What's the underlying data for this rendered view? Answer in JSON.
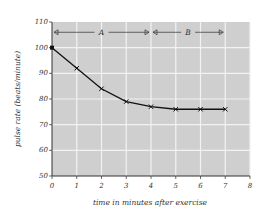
{
  "chart_data": {
    "type": "line",
    "title": "",
    "xlabel": "time in minutes after exercise",
    "ylabel": "pulse rate (beats/minute)",
    "x": [
      0,
      1,
      2,
      3,
      4,
      5,
      6,
      7
    ],
    "series": [
      {
        "name": "pulse rate",
        "values": [
          100,
          92,
          84,
          79,
          77,
          76,
          76,
          76
        ]
      }
    ],
    "xlim": [
      0,
      8
    ],
    "ylim": [
      50,
      110
    ],
    "xticks": [
      "0",
      "1",
      "2",
      "3",
      "4",
      "5",
      "6",
      "7",
      "8"
    ],
    "yticks": [
      "50",
      "60",
      "70",
      "80",
      "90",
      "100",
      "110"
    ],
    "grid": true,
    "annotations": [
      {
        "label": "A",
        "x_start": 0,
        "x_end": 4,
        "y": 106
      },
      {
        "label": "B",
        "x_start": 4,
        "x_end": 7,
        "y": 106
      }
    ],
    "colors": {
      "plot_bg": "#cfcfcf",
      "grid": "#f2f2f2",
      "line": "#111111"
    }
  }
}
